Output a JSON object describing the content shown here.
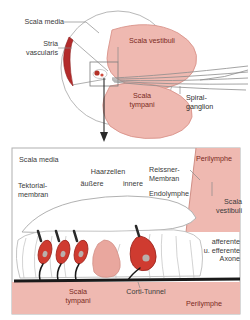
{
  "figure": {
    "language": "de"
  },
  "colors": {
    "perilymph_fill": "#efb9b1",
    "perilymph_stroke": "#d9938a",
    "stria_red": "#b32b2b",
    "hair_cell_red": "#cf3b30",
    "hair_cell_dark_red": "#a82a22",
    "nucleus_gray": "#b9b0ac",
    "nerve_gray": "#8d8d8d",
    "axon_black": "#1a1a1a",
    "outline_gray": "#9a9a9a",
    "text_dark": "#3a3a3a",
    "text_maroon": "#7a2a22",
    "panel_border": "#b0b0b0",
    "background": "#ffffff"
  },
  "top_panel": {
    "name": "cochlear-duct-overview",
    "labels": {
      "scala_media": "Scala media",
      "stria_vascularis": "Stria\nvascularis",
      "scala_vestibuli": "Scala vestibuli",
      "scala_tympani": "Scala\ntympani",
      "spiral_ganglion": "Spiral-\nganglion"
    }
  },
  "connector": {
    "name": "zoom-arrow",
    "direction": "down"
  },
  "bottom_panel": {
    "name": "organ-of-corti-detail",
    "labels": {
      "scala_media": "Scala media",
      "tektorial_membran": "Tektorial-\nmembran",
      "haarzellen": "Haarzellen",
      "aeussere": "äußere",
      "innere": "innere",
      "reissner_membran": "Reissner-\nMembran",
      "endolymphe": "Endolymphe",
      "perilymphe_top": "Perilymphe",
      "scala_vestibuli": "Scala\nvestibuli",
      "afferente_axone": "afferente\nu. efferente\nAxone",
      "scala_tympani": "Scala\ntympani",
      "corti_tunnel": "Corti-Tunnel",
      "perilymphe_bottom": "Perilymphe"
    }
  }
}
